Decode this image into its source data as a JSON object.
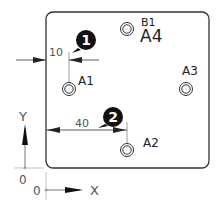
{
  "diagram": {
    "plate": {
      "x": 46,
      "y": 12,
      "width": 163,
      "height": 156,
      "corner_radius": 7
    },
    "holes": [
      {
        "label": "A1",
        "cx": 69,
        "cy": 89,
        "label_x": 78,
        "label_y": 85
      },
      {
        "label": "A2",
        "cx": 127,
        "cy": 150,
        "label_x": 143,
        "label_y": 147
      },
      {
        "label": "A3",
        "cx": 186,
        "cy": 89,
        "label_x": 183,
        "label_y": 75
      },
      {
        "label": "A4",
        "cx": 127,
        "cy": 29,
        "label_x": 140,
        "label_y": 42,
        "secondary_label": "B1",
        "secondary_x": 141,
        "secondary_y": 26
      }
    ],
    "dimensions": [
      {
        "value": "10",
        "text_x": 49,
        "text_y": 56,
        "line_y": 60
      },
      {
        "value": "40",
        "text_x": 77,
        "text_y": 128,
        "line_y": 130
      }
    ],
    "balloons": [
      {
        "number": "1",
        "cx": 86,
        "cy": 40
      },
      {
        "number": "2",
        "cx": 113,
        "cy": 117
      }
    ],
    "axes": {
      "y_label": "Y",
      "x_label": "X",
      "y_origin_label": "0",
      "x_origin_label": "0"
    },
    "colors": {
      "line": "#333333",
      "balloon": "#111111",
      "dim_text": "#555555"
    }
  }
}
